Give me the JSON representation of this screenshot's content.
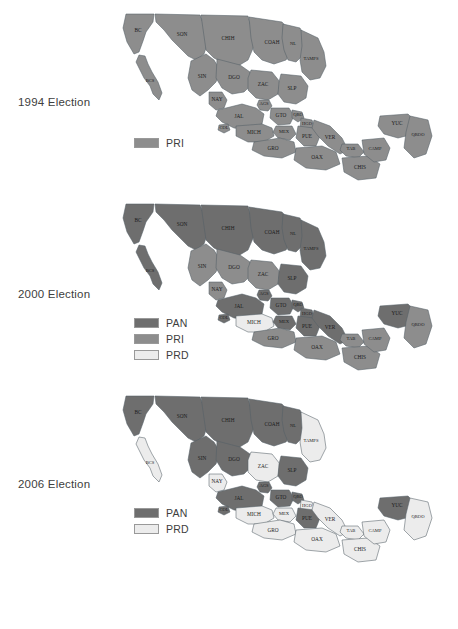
{
  "figure": {
    "caption": ""
  },
  "colors": {
    "pan": "#6e6e6e",
    "pri": "#8d8d8d",
    "prd": "#ececec",
    "border": "#555f66",
    "background": "#ffffff",
    "text": "#3a3a3a"
  },
  "panels": [
    {
      "id": "election-1994",
      "title": "1994 Election",
      "legend": [
        {
          "label": "PRI",
          "party": "pri"
        }
      ],
      "results": {
        "BC": "pri",
        "BCS": "pri",
        "SON": "pri",
        "CHIH": "pri",
        "COAH": "pri",
        "NL": "pri",
        "TAMPS": "pri",
        "SIN": "pri",
        "DGO": "pri",
        "ZAC": "pri",
        "SLP": "pri",
        "NAY": "pri",
        "AGS": "pri",
        "JAL": "pri",
        "GTO": "pri",
        "QRO": "pri",
        "HGO": "pri",
        "COL": "pri",
        "MICH": "pri",
        "MEX": "pri",
        "DF": "pri",
        "MOR": "pri",
        "TLAX": "pri",
        "PUE": "pri",
        "VER": "pri",
        "GRO": "pri",
        "OAX": "pri",
        "TAB": "pri",
        "CHIS": "pri",
        "CAMP": "pri",
        "YUC": "pri",
        "QROO": "pri"
      }
    },
    {
      "id": "election-2000",
      "title": "2000 Election",
      "legend": [
        {
          "label": "PAN",
          "party": "pan"
        },
        {
          "label": "PRI",
          "party": "pri"
        },
        {
          "label": "PRD",
          "party": "prd"
        }
      ],
      "results": {
        "BC": "pan",
        "BCS": "pan",
        "SON": "pan",
        "CHIH": "pan",
        "COAH": "pan",
        "NL": "pan",
        "TAMPS": "pan",
        "SIN": "pri",
        "DGO": "pri",
        "ZAC": "pri",
        "SLP": "pan",
        "NAY": "pri",
        "AGS": "pan",
        "JAL": "pan",
        "GTO": "pan",
        "QRO": "pan",
        "HGO": "pan",
        "COL": "pan",
        "MICH": "prd",
        "MEX": "pan",
        "DF": "pan",
        "MOR": "pan",
        "TLAX": "pan",
        "PUE": "pan",
        "VER": "pan",
        "GRO": "pri",
        "OAX": "pri",
        "TAB": "pri",
        "CHIS": "pri",
        "CAMP": "pri",
        "YUC": "pan",
        "QROO": "pri"
      }
    },
    {
      "id": "election-2006",
      "title": "2006 Election",
      "legend": [
        {
          "label": "PAN",
          "party": "pan"
        },
        {
          "label": "PRD",
          "party": "prd"
        }
      ],
      "results": {
        "BC": "pan",
        "BCS": "prd",
        "SON": "pan",
        "CHIH": "pan",
        "COAH": "pan",
        "NL": "pan",
        "TAMPS": "prd",
        "SIN": "pan",
        "DGO": "pan",
        "ZAC": "prd",
        "SLP": "pan",
        "NAY": "prd",
        "AGS": "pan",
        "JAL": "pan",
        "GTO": "pan",
        "QRO": "pan",
        "HGO": "prd",
        "COL": "pan",
        "MICH": "prd",
        "MEX": "prd",
        "DF": "prd",
        "MOR": "pan",
        "TLAX": "prd",
        "PUE": "pan",
        "VER": "prd",
        "GRO": "prd",
        "OAX": "prd",
        "TAB": "prd",
        "CHIS": "prd",
        "CAMP": "prd",
        "YUC": "pan",
        "QROO": "prd"
      }
    }
  ],
  "state_labels": {
    "BC": "BC",
    "BCS": "BCS",
    "SON": "SON",
    "CHIH": "CHIH",
    "COAH": "COAH",
    "NL": "NL",
    "TAMPS": "TAMPS",
    "SIN": "SIN",
    "DGO": "DGO",
    "ZAC": "ZAC",
    "SLP": "SLP",
    "NAY": "NAY",
    "AGS": "AGS",
    "JAL": "JAL",
    "GTO": "GTO",
    "QRO": "QRO",
    "HGO": "HGO",
    "COL": "COL",
    "MICH": "MICH",
    "MEX": "MEX",
    "PUE": "PUE",
    "VER": "VER",
    "GRO": "GRO",
    "OAX": "OAX",
    "TAB": "TAB",
    "CHIS": "CHIS",
    "CAMP": "CAMP",
    "YUC": "YUC",
    "QROO": "QROO"
  },
  "chart_data": {
    "type": "map",
    "panels": [
      "1994 Election",
      "2000 Election",
      "2006 Election"
    ],
    "parties": [
      "PAN",
      "PRI",
      "PRD"
    ],
    "legend_position": "left-below-title",
    "regions": [
      "BC",
      "BCS",
      "SON",
      "CHIH",
      "COAH",
      "NL",
      "TAMPS",
      "SIN",
      "DGO",
      "ZAC",
      "SLP",
      "NAY",
      "AGS",
      "JAL",
      "GTO",
      "QRO",
      "HGO",
      "COL",
      "MICH",
      "MEX",
      "PUE",
      "VER",
      "GRO",
      "OAX",
      "TAB",
      "CHIS",
      "CAMP",
      "YUC",
      "QROO"
    ],
    "series": [
      {
        "name": "1994 Election",
        "values": {
          "BC": "PRI",
          "BCS": "PRI",
          "SON": "PRI",
          "CHIH": "PRI",
          "COAH": "PRI",
          "NL": "PRI",
          "TAMPS": "PRI",
          "SIN": "PRI",
          "DGO": "PRI",
          "ZAC": "PRI",
          "SLP": "PRI",
          "NAY": "PRI",
          "AGS": "PRI",
          "JAL": "PRI",
          "GTO": "PRI",
          "QRO": "PRI",
          "HGO": "PRI",
          "COL": "PRI",
          "MICH": "PRI",
          "MEX": "PRI",
          "PUE": "PRI",
          "VER": "PRI",
          "GRO": "PRI",
          "OAX": "PRI",
          "TAB": "PRI",
          "CHIS": "PRI",
          "CAMP": "PRI",
          "YUC": "PRI",
          "QROO": "PRI"
        }
      },
      {
        "name": "2000 Election",
        "values": {
          "BC": "PAN",
          "BCS": "PAN",
          "SON": "PAN",
          "CHIH": "PAN",
          "COAH": "PAN",
          "NL": "PAN",
          "TAMPS": "PAN",
          "SIN": "PRI",
          "DGO": "PRI",
          "ZAC": "PRI",
          "SLP": "PAN",
          "NAY": "PRI",
          "AGS": "PAN",
          "JAL": "PAN",
          "GTO": "PAN",
          "QRO": "PAN",
          "HGO": "PAN",
          "COL": "PAN",
          "MICH": "PRD",
          "MEX": "PAN",
          "PUE": "PAN",
          "VER": "PAN",
          "GRO": "PRI",
          "OAX": "PRI",
          "TAB": "PRI",
          "CHIS": "PRI",
          "CAMP": "PRI",
          "YUC": "PAN",
          "QROO": "PRI"
        }
      },
      {
        "name": "2006 Election",
        "values": {
          "BC": "PAN",
          "BCS": "PRD",
          "SON": "PAN",
          "CHIH": "PAN",
          "COAH": "PAN",
          "NL": "PAN",
          "TAMPS": "PRD",
          "SIN": "PAN",
          "DGO": "PAN",
          "ZAC": "PRD",
          "SLP": "PAN",
          "NAY": "PRD",
          "AGS": "PAN",
          "JAL": "PAN",
          "GTO": "PAN",
          "QRO": "PAN",
          "HGO": "PRD",
          "COL": "PAN",
          "MICH": "PRD",
          "MEX": "PRD",
          "PUE": "PAN",
          "VER": "PRD",
          "GRO": "PRD",
          "OAX": "PRD",
          "TAB": "PRD",
          "CHIS": "PRD",
          "CAMP": "PRD",
          "YUC": "PAN",
          "QROO": "PRD"
        }
      }
    ]
  }
}
